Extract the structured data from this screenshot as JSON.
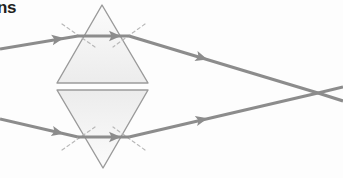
{
  "figure": {
    "title_fragment": "ns",
    "canvas": {
      "width": 343,
      "height": 178,
      "background": "#fdfdfd"
    },
    "colors": {
      "ray": "#8c8c8c",
      "prism_stroke": "#9a9a9a",
      "prism_fill": "#f4f4f4",
      "normal_dash": "#b8b8b8",
      "text": "#231f20"
    },
    "stroke_widths": {
      "ray": 3.1,
      "prism": 1.4,
      "normal": 1.2
    }
  },
  "elements": {
    "upper_prism": {
      "label": "upper-prism",
      "orientation": "apex-up",
      "apex": {
        "x": 102,
        "y": 5
      },
      "base_left": {
        "x": 57,
        "y": 83
      },
      "base_right": {
        "x": 148,
        "y": 83
      }
    },
    "lower_prism": {
      "label": "lower-prism",
      "orientation": "apex-down",
      "apex": {
        "x": 103,
        "y": 168
      },
      "base_left": {
        "x": 57,
        "y": 90
      },
      "base_right": {
        "x": 148,
        "y": 90
      }
    },
    "rays": [
      {
        "name": "upper-incident-ray",
        "points": "0,49 78,36",
        "arrow_at": {
          "x": 52,
          "y": 40
        },
        "arrow_angle": -9.5
      },
      {
        "name": "upper-internal-ray",
        "points": "78,36 129,36",
        "arrow_at": {
          "x": 109,
          "y": 36
        },
        "arrow_angle": 0
      },
      {
        "name": "upper-refracted-ray",
        "points": "129,36 318,93",
        "arrow_at": {
          "x": 196,
          "y": 56
        },
        "arrow_angle": 16.8
      },
      {
        "name": "upper-ray-continuation",
        "points": "318,93 343,101",
        "arrow_at": null,
        "arrow_angle": 0
      },
      {
        "name": "lower-incident-ray",
        "points": "0,119 78,137",
        "arrow_at": {
          "x": 52,
          "y": 131
        },
        "arrow_angle": 13.0
      },
      {
        "name": "lower-internal-ray",
        "points": "78,137 129,137",
        "arrow_at": {
          "x": 109,
          "y": 137
        },
        "arrow_angle": 0
      },
      {
        "name": "lower-refracted-ray",
        "points": "129,137 318,93",
        "arrow_at": {
          "x": 196,
          "y": 121
        },
        "arrow_angle": -13.1
      },
      {
        "name": "lower-ray-continuation",
        "points": "318,93 343,87",
        "arrow_at": null,
        "arrow_angle": 0
      }
    ],
    "normals": [
      {
        "name": "upper-entry-normal",
        "points": "62,24 95,47"
      },
      {
        "name": "upper-exit-normal",
        "points": "145,24 113,47"
      },
      {
        "name": "lower-entry-normal",
        "points": "62,150 95,127"
      },
      {
        "name": "lower-exit-normal",
        "points": "145,150 113,127"
      }
    ],
    "focal_point": {
      "name": "convergence-point",
      "x": 318,
      "y": 93
    }
  }
}
